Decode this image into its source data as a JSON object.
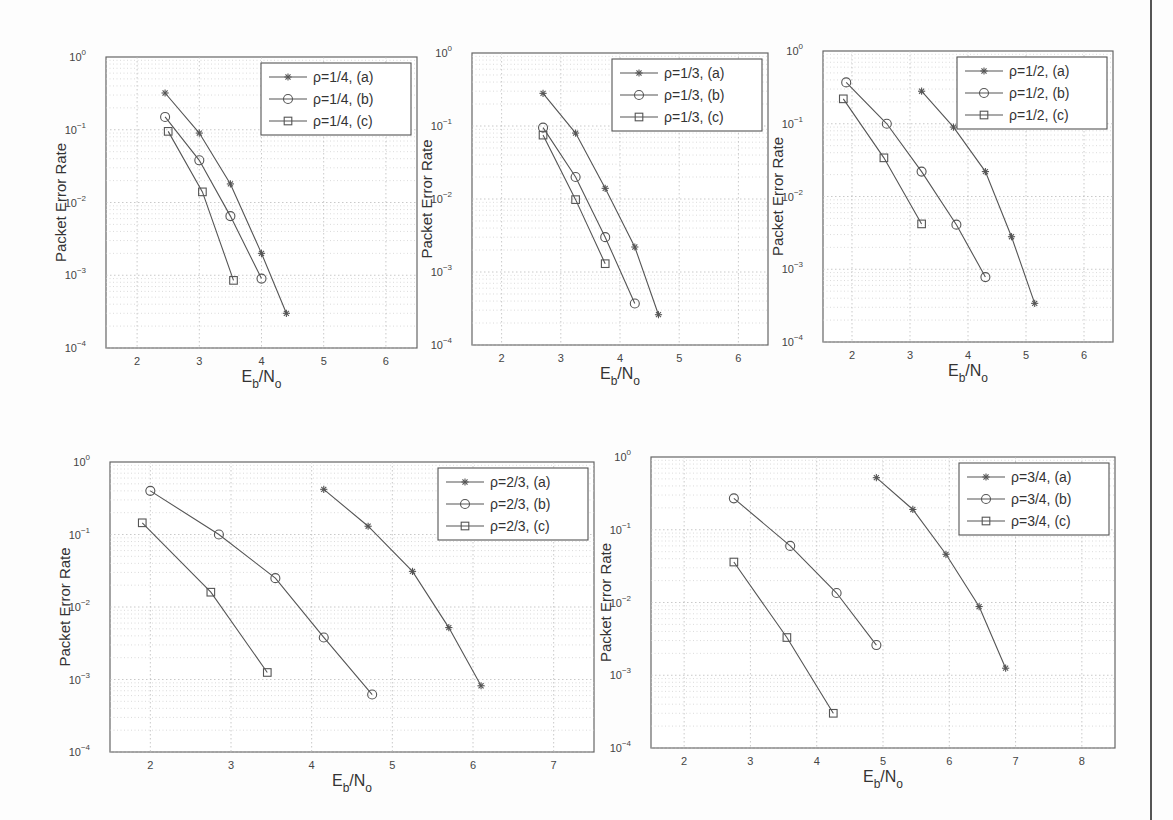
{
  "chart_data": [
    {
      "id": "rho-1-4",
      "type": "line",
      "title": "",
      "xlabel": "Eb/No",
      "ylabel": "Packet Error Rate",
      "yscale": "log",
      "xlim": [
        1.5,
        6.5
      ],
      "ylim": [
        0.0001,
        1
      ],
      "xticks": [
        2,
        3,
        4,
        5,
        6
      ],
      "yticks": [
        "10^0",
        "10^-1",
        "10^-2",
        "10^-3",
        "10^-4"
      ],
      "grid": true,
      "legend_position": "upper right",
      "box": {
        "left": 106,
        "top": 57,
        "right": 417,
        "bottom": 348
      },
      "series": [
        {
          "name": "ρ=1/4, (a)",
          "marker": "star",
          "x": [
            2.45,
            3.0,
            3.5,
            4.0,
            4.4
          ],
          "y": [
            0.32,
            0.09,
            0.018,
            0.002,
            0.0003
          ]
        },
        {
          "name": "ρ=1/4, (b)",
          "marker": "circle",
          "x": [
            2.45,
            3.0,
            3.5,
            4.0
          ],
          "y": [
            0.15,
            0.038,
            0.0065,
            0.0009
          ]
        },
        {
          "name": "ρ=1/4, (c)",
          "marker": "square",
          "x": [
            2.5,
            3.05,
            3.55
          ],
          "y": [
            0.095,
            0.014,
            0.00085
          ]
        }
      ]
    },
    {
      "id": "rho-1-3",
      "type": "line",
      "title": "",
      "xlabel": "Eb/No",
      "ylabel": "Packet Error Rate",
      "yscale": "log",
      "xlim": [
        1.5,
        6.5
      ],
      "ylim": [
        0.0001,
        1
      ],
      "xticks": [
        2,
        3,
        4,
        5,
        6
      ],
      "yticks": [
        "10^0",
        "10^-1",
        "10^-2",
        "10^-3",
        "10^-4"
      ],
      "grid": true,
      "legend_position": "upper right",
      "box": {
        "left": 472,
        "top": 53,
        "right": 768,
        "bottom": 345
      },
      "series": [
        {
          "name": "ρ=1/3, (a)",
          "marker": "star",
          "x": [
            2.7,
            3.25,
            3.75,
            4.25,
            4.65
          ],
          "y": [
            0.28,
            0.08,
            0.014,
            0.0022,
            0.00026
          ]
        },
        {
          "name": "ρ=1/3, (b)",
          "marker": "circle",
          "x": [
            2.7,
            3.25,
            3.75,
            4.25
          ],
          "y": [
            0.095,
            0.02,
            0.003,
            0.00037
          ]
        },
        {
          "name": "ρ=1/3, (c)",
          "marker": "square",
          "x": [
            2.7,
            3.25,
            3.75
          ],
          "y": [
            0.075,
            0.0098,
            0.0013
          ]
        }
      ]
    },
    {
      "id": "rho-1-2",
      "type": "line",
      "title": "",
      "xlabel": "Eb/No",
      "ylabel": "Packet Error Rate",
      "yscale": "log",
      "xlim": [
        1.5,
        6.5
      ],
      "ylim": [
        0.0001,
        1
      ],
      "xticks": [
        2,
        3,
        4,
        5,
        6
      ],
      "yticks": [
        "10^0",
        "10^-1",
        "10^-2",
        "10^-3",
        "10^-4"
      ],
      "grid": true,
      "legend_position": "upper right",
      "box": {
        "left": 823,
        "top": 51,
        "right": 1113,
        "bottom": 342
      },
      "series": [
        {
          "name": "ρ=1/2, (a)",
          "marker": "star",
          "x": [
            3.2,
            3.75,
            4.3,
            4.75,
            5.15
          ],
          "y": [
            0.28,
            0.09,
            0.022,
            0.0028,
            0.00034
          ]
        },
        {
          "name": "ρ=1/2, (b)",
          "marker": "circle",
          "x": [
            1.9,
            2.6,
            3.2,
            3.8,
            4.3
          ],
          "y": [
            0.37,
            0.1,
            0.022,
            0.0041,
            0.00078
          ]
        },
        {
          "name": "ρ=1/2, (c)",
          "marker": "square",
          "x": [
            1.85,
            2.55,
            3.2
          ],
          "y": [
            0.22,
            0.034,
            0.0042
          ]
        }
      ]
    },
    {
      "id": "rho-2-3",
      "type": "line",
      "title": "",
      "xlabel": "Eb/No",
      "ylabel": "Packet Error Rate",
      "yscale": "log",
      "xlim": [
        1.5,
        7.5
      ],
      "ylim": [
        0.0001,
        1
      ],
      "xticks": [
        2,
        3,
        4,
        5,
        6,
        7
      ],
      "yticks": [
        "10^0",
        "10^-1",
        "10^-2",
        "10^-3",
        "10^-4"
      ],
      "grid": true,
      "legend_position": "upper right",
      "box": {
        "left": 110,
        "top": 462,
        "right": 594,
        "bottom": 752
      },
      "series": [
        {
          "name": "ρ=2/3, (a)",
          "marker": "star",
          "x": [
            4.15,
            4.7,
            5.25,
            5.7,
            6.1
          ],
          "y": [
            0.42,
            0.13,
            0.031,
            0.0052,
            0.00082
          ]
        },
        {
          "name": "ρ=2/3, (b)",
          "marker": "circle",
          "x": [
            2.0,
            2.85,
            3.55,
            4.15,
            4.75
          ],
          "y": [
            0.4,
            0.1,
            0.025,
            0.0038,
            0.00062
          ]
        },
        {
          "name": "ρ=2/3, (c)",
          "marker": "square",
          "x": [
            1.9,
            2.75,
            3.45
          ],
          "y": [
            0.145,
            0.016,
            0.00125
          ]
        }
      ]
    },
    {
      "id": "rho-3-4",
      "type": "line",
      "title": "",
      "xlabel": "Eb/No",
      "ylabel": "Packet Error Rate",
      "yscale": "log",
      "xlim": [
        1.5,
        8.5
      ],
      "ylim": [
        0.0001,
        1
      ],
      "xticks": [
        2,
        3,
        4,
        5,
        6,
        7,
        8
      ],
      "yticks": [
        "10^0",
        "10^-1",
        "10^-2",
        "10^-3",
        "10^-4"
      ],
      "grid": true,
      "legend_position": "upper right",
      "box": {
        "left": 651,
        "top": 457,
        "right": 1115,
        "bottom": 748
      },
      "series": [
        {
          "name": "ρ=3/4, (a)",
          "marker": "star",
          "x": [
            4.9,
            5.45,
            5.95,
            6.45,
            6.85
          ],
          "y": [
            0.52,
            0.19,
            0.046,
            0.0088,
            0.00125
          ]
        },
        {
          "name": "ρ=3/4, (b)",
          "marker": "circle",
          "x": [
            2.75,
            3.6,
            4.3,
            4.9
          ],
          "y": [
            0.27,
            0.06,
            0.0135,
            0.0026
          ]
        },
        {
          "name": "ρ=3/4, (c)",
          "marker": "square",
          "x": [
            2.75,
            3.55,
            4.25
          ],
          "y": [
            0.036,
            0.0033,
            0.0003
          ]
        }
      ]
    }
  ]
}
